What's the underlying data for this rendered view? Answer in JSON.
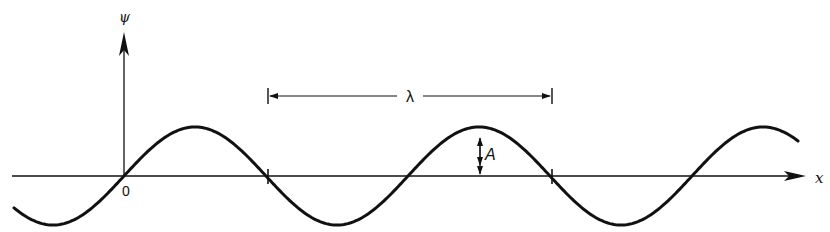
{
  "figure": {
    "type": "sinusoidal wave diagram",
    "y_axis_label": "ψ",
    "x_axis_label": "x",
    "origin_label": "0",
    "wavelength_label": "λ",
    "amplitude_label": "A",
    "colors": {
      "stroke": "#111111",
      "background": "#ffffff"
    }
  },
  "geometry": {
    "axis_y": 176,
    "origin_x": 124,
    "amplitude_px": 49,
    "wavelength_px": 284,
    "wave_x_start": 14,
    "wave_x_end": 798,
    "zero_crossings_x": [
      124,
      268,
      407,
      552,
      692
    ],
    "wavelength_marker": {
      "x1": 268,
      "x2": 552,
      "y": 96
    },
    "amplitude_marker": {
      "x": 480,
      "y_top": 127,
      "y_bottom": 176
    }
  }
}
